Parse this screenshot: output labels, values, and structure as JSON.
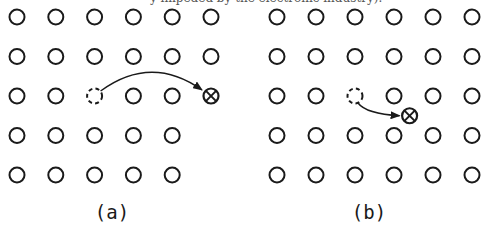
{
  "header_fragment": "y impeded by the electronic industry).",
  "colors": {
    "stroke": "#1a1a1a",
    "background": "#ffffff"
  },
  "panels": [
    {
      "id": "a",
      "label": "(a)",
      "description": "Vacancy with atom displaced to a distant lattice site",
      "rows": 5,
      "cols": 6,
      "missing_sites": [
        [
          3,
          6
        ],
        [
          4,
          6
        ],
        [
          5,
          6
        ]
      ],
      "vacancy_site": [
        3,
        3
      ],
      "interstitial": {
        "kind": "lattice-site",
        "row": 3,
        "col": 6
      },
      "arrow": {
        "from": "vacancy",
        "to": "interstitial"
      }
    },
    {
      "id": "b",
      "label": "(b)",
      "description": "Vacancy with atom displaced to a nearby interstitial position",
      "rows": 5,
      "cols": 6,
      "missing_sites": [],
      "vacancy_site": [
        3,
        3
      ],
      "interstitial": {
        "kind": "interstitial",
        "row": 3.5,
        "col": 4.4
      },
      "arrow": {
        "from": "vacancy",
        "to": "interstitial"
      }
    }
  ],
  "legend_symbols": {
    "atom": "open-circle",
    "vacancy": "dashed-circle",
    "interstitial": "circled-x"
  }
}
